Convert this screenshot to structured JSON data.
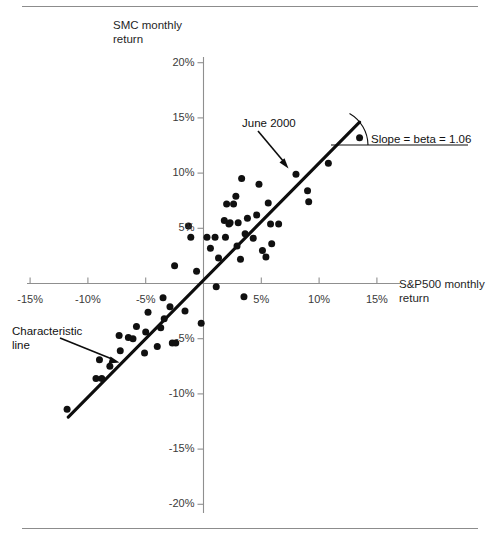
{
  "figure": {
    "background": "#ffffff",
    "ink_color": "#101010",
    "axis_color": "#8f8f8f",
    "rule_color": "#8c8c8c"
  },
  "annotations": {
    "june_2000": "June 2000",
    "slope": "Slope = beta = 1.06",
    "characteristic_line": "Characteristic\nline"
  },
  "chart_data": {
    "type": "scatter",
    "title": "",
    "xlabel": "S&P500 monthly return",
    "ylabel": "SMC monthly return",
    "xlim": [
      -17.5,
      17.5
    ],
    "ylim": [
      -20,
      20
    ],
    "grid": false,
    "legend": null,
    "xticks": [
      "-15%",
      "-10%",
      "-5%",
      "5%",
      "10%",
      "15%"
    ],
    "xtick_values": [
      -15,
      -10,
      -5,
      5,
      10,
      15
    ],
    "yticks": [
      "20%",
      "15%",
      "10%",
      "5%",
      "-5%",
      "-10%",
      "-15%",
      "-20%"
    ],
    "ytick_values": [
      20,
      15,
      10,
      5,
      -5,
      -10,
      -15,
      -20
    ],
    "fit_line": {
      "label": "Characteristic line",
      "slope": 1.06,
      "intercept": 0.3,
      "x_start": -11.7,
      "x_end": 13.5
    },
    "highlight_point": {
      "label": "June 2000",
      "x": 8.0,
      "y": 9.9
    },
    "series": [
      {
        "name": "SMC vs S&P500 monthly returns",
        "marker": "circle",
        "color": "#101010",
        "points": [
          [
            -11.8,
            -11.4
          ],
          [
            -9.3,
            -8.6
          ],
          [
            -8.8,
            -8.6
          ],
          [
            -9.0,
            -6.9
          ],
          [
            -8.1,
            -7.5
          ],
          [
            -7.2,
            -6.1
          ],
          [
            -7.3,
            -4.7
          ],
          [
            -6.5,
            -4.9
          ],
          [
            -6.1,
            -5.0
          ],
          [
            -5.8,
            -3.9
          ],
          [
            -5.1,
            -6.3
          ],
          [
            -5.0,
            -4.4
          ],
          [
            -4.8,
            -2.6
          ],
          [
            -4.0,
            -5.7
          ],
          [
            -3.7,
            -4.0
          ],
          [
            -3.5,
            -1.3
          ],
          [
            -3.4,
            -3.2
          ],
          [
            -2.9,
            -2.1
          ],
          [
            -2.7,
            -5.4
          ],
          [
            -2.4,
            -5.4
          ],
          [
            -2.5,
            1.6
          ],
          [
            -1.6,
            -2.5
          ],
          [
            -1.3,
            5.2
          ],
          [
            -1.1,
            4.2
          ],
          [
            -0.6,
            1.1
          ],
          [
            -0.2,
            -3.6
          ],
          [
            0.3,
            4.2
          ],
          [
            0.6,
            3.2
          ],
          [
            1.0,
            4.2
          ],
          [
            1.1,
            -0.3
          ],
          [
            1.3,
            2.3
          ],
          [
            1.8,
            5.7
          ],
          [
            1.9,
            4.2
          ],
          [
            2.0,
            7.2
          ],
          [
            2.2,
            5.4
          ],
          [
            2.3,
            5.5
          ],
          [
            2.6,
            7.2
          ],
          [
            2.8,
            7.9
          ],
          [
            2.9,
            3.4
          ],
          [
            3.0,
            5.5
          ],
          [
            3.2,
            2.2
          ],
          [
            3.3,
            9.5
          ],
          [
            3.5,
            -1.2
          ],
          [
            3.6,
            4.5
          ],
          [
            3.8,
            5.9
          ],
          [
            4.3,
            4.1
          ],
          [
            4.6,
            6.2
          ],
          [
            4.8,
            9.0
          ],
          [
            5.1,
            3.0
          ],
          [
            5.4,
            2.4
          ],
          [
            5.6,
            7.3
          ],
          [
            5.8,
            5.4
          ],
          [
            5.9,
            3.6
          ],
          [
            6.5,
            5.4
          ],
          [
            8.0,
            9.9
          ],
          [
            9.0,
            8.4
          ],
          [
            9.1,
            7.4
          ],
          [
            10.8,
            10.9
          ],
          [
            13.5,
            13.2
          ]
        ]
      }
    ]
  }
}
